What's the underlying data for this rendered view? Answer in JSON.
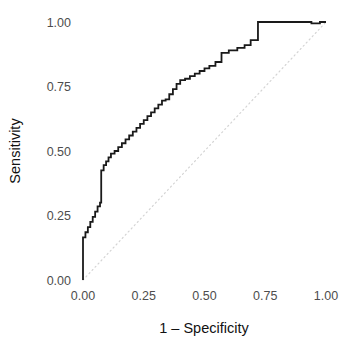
{
  "chart_data": {
    "type": "line",
    "title": "",
    "subtitle": "",
    "xlabel": "1 – Specificity",
    "ylabel": "Sensitivity",
    "xlim": [
      0.0,
      1.0
    ],
    "ylim": [
      0.0,
      1.0
    ],
    "grid": false,
    "legend": "none",
    "xticks": [
      "0.00",
      "0.25",
      "0.50",
      "0.75",
      "1.00"
    ],
    "xtick_values": [
      0.0,
      0.25,
      0.5,
      0.75,
      1.0
    ],
    "yticks": [
      "0.00",
      "0.25",
      "0.50",
      "0.75",
      "1.00"
    ],
    "ytick_values": [
      0.0,
      0.25,
      0.5,
      0.75,
      1.0
    ],
    "series": [
      {
        "name": "ROC curve",
        "style": "step",
        "color": "#1a1a1a",
        "line_width": 1.8,
        "x": [
          0.0,
          0.0,
          0.01,
          0.01,
          0.02,
          0.02,
          0.03,
          0.03,
          0.04,
          0.04,
          0.05,
          0.05,
          0.06,
          0.06,
          0.07,
          0.07,
          0.075,
          0.075,
          0.085,
          0.085,
          0.095,
          0.095,
          0.105,
          0.105,
          0.115,
          0.115,
          0.13,
          0.13,
          0.145,
          0.145,
          0.16,
          0.16,
          0.175,
          0.175,
          0.19,
          0.19,
          0.205,
          0.205,
          0.22,
          0.22,
          0.235,
          0.235,
          0.25,
          0.25,
          0.265,
          0.265,
          0.28,
          0.28,
          0.295,
          0.295,
          0.31,
          0.31,
          0.325,
          0.325,
          0.34,
          0.34,
          0.355,
          0.355,
          0.37,
          0.37,
          0.385,
          0.385,
          0.4,
          0.4,
          0.42,
          0.42,
          0.44,
          0.44,
          0.46,
          0.46,
          0.48,
          0.48,
          0.5,
          0.5,
          0.52,
          0.52,
          0.545,
          0.545,
          0.57,
          0.57,
          0.6,
          0.6,
          0.635,
          0.635,
          0.665,
          0.665,
          0.69,
          0.69,
          0.72,
          0.72,
          0.86,
          0.86,
          0.94,
          0.94,
          0.975,
          0.975,
          1.0
        ],
        "y": [
          0.0,
          0.165,
          0.165,
          0.185,
          0.185,
          0.205,
          0.205,
          0.225,
          0.225,
          0.245,
          0.245,
          0.265,
          0.265,
          0.285,
          0.285,
          0.3,
          0.3,
          0.425,
          0.425,
          0.445,
          0.445,
          0.46,
          0.46,
          0.475,
          0.475,
          0.49,
          0.49,
          0.5,
          0.5,
          0.515,
          0.515,
          0.53,
          0.53,
          0.545,
          0.545,
          0.56,
          0.56,
          0.575,
          0.575,
          0.59,
          0.59,
          0.605,
          0.605,
          0.62,
          0.62,
          0.635,
          0.635,
          0.65,
          0.65,
          0.665,
          0.665,
          0.68,
          0.68,
          0.695,
          0.695,
          0.7,
          0.7,
          0.72,
          0.72,
          0.74,
          0.74,
          0.76,
          0.76,
          0.775,
          0.775,
          0.78,
          0.78,
          0.79,
          0.79,
          0.8,
          0.8,
          0.81,
          0.81,
          0.82,
          0.82,
          0.83,
          0.83,
          0.845,
          0.845,
          0.88,
          0.88,
          0.89,
          0.89,
          0.9,
          0.9,
          0.91,
          0.91,
          0.93,
          0.93,
          1.0,
          1.0,
          1.0,
          1.0,
          0.995,
          0.995,
          1.0,
          1.0
        ]
      },
      {
        "name": "Chance diagonal",
        "style": "dotted",
        "color": "#d4d4d4",
        "line_width": 1.2,
        "x": [
          0.0,
          1.0
        ],
        "y": [
          0.0,
          1.0
        ]
      }
    ],
    "annotations": []
  },
  "axes": {
    "x_title": "1 – Specificity",
    "y_title": "Sensitivity",
    "x_tick_labels": [
      "0.00",
      "0.25",
      "0.50",
      "0.75",
      "1.00"
    ],
    "y_tick_labels": [
      "0.00",
      "0.25",
      "0.50",
      "0.75",
      "1.00"
    ]
  },
  "colors": {
    "curve": "#1a1a1a",
    "diagonal": "#d4d4d4",
    "tick_label": "#4d4d4d",
    "axis_title": "#111111",
    "background": "#ffffff"
  }
}
